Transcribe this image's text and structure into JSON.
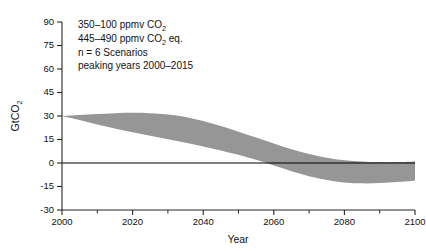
{
  "chart_data": {
    "type": "area",
    "title": "",
    "xlabel": "Year",
    "ylabel": "GtCO2",
    "ylabel_display": "GtCO₂",
    "xlim": [
      2000,
      2100
    ],
    "ylim": [
      -30,
      90
    ],
    "grid": false,
    "legend": null,
    "band_color": "#969696",
    "zero_line": 0,
    "x_ticks": [
      2000,
      2020,
      2040,
      2060,
      2080,
      2100
    ],
    "x_tick_labels": [
      "2000",
      "2020",
      "2040",
      "2060",
      "2080",
      "2100"
    ],
    "x_minor_ticks": [
      2010,
      2030,
      2050,
      2070,
      2090
    ],
    "y_ticks": [
      -30,
      -15,
      0,
      15,
      30,
      45,
      60,
      75,
      90
    ],
    "y_tick_labels": [
      "-30",
      "-15",
      "0",
      "15",
      "30",
      "45",
      "60",
      "75",
      "90"
    ],
    "series": [
      {
        "name": "Upper bound of scenario band",
        "x": [
          2000,
          2005,
          2010,
          2015,
          2020,
          2025,
          2030,
          2035,
          2040,
          2045,
          2050,
          2055,
          2060,
          2065,
          2070,
          2075,
          2080,
          2085,
          2090,
          2095,
          2100
        ],
        "values": [
          30.0,
          30.6,
          31.2,
          31.8,
          32.0,
          31.8,
          31.0,
          29.4,
          26.8,
          23.6,
          20.0,
          16.2,
          12.4,
          8.8,
          5.8,
          3.4,
          1.8,
          1.0,
          0.6,
          0.6,
          1.0
        ]
      },
      {
        "name": "Lower bound of scenario band",
        "x": [
          2000,
          2005,
          2010,
          2015,
          2020,
          2025,
          2030,
          2035,
          2040,
          2045,
          2050,
          2055,
          2060,
          2065,
          2070,
          2075,
          2080,
          2085,
          2090,
          2095,
          2100
        ],
        "values": [
          30.0,
          27.4,
          24.6,
          22.0,
          19.6,
          17.4,
          15.2,
          13.0,
          10.6,
          8.0,
          5.2,
          2.0,
          -1.6,
          -5.2,
          -8.4,
          -10.8,
          -12.4,
          -13.0,
          -12.8,
          -12.2,
          -11.4
        ]
      }
    ],
    "annotations": [
      {
        "id": "scenario-note",
        "lines": [
          {
            "id": "line-1",
            "pre": "350–100 ppmv CO",
            "sub": "2",
            "post": ""
          },
          {
            "id": "line-2",
            "pre": "445–490 ppmv CO",
            "sub": "2",
            "post": " eq."
          },
          {
            "id": "line-3",
            "pre": "n = 6 Scenarios",
            "sub": "",
            "post": ""
          },
          {
            "id": "line-4",
            "pre": "peaking years 2000–2015",
            "sub": "",
            "post": ""
          }
        ]
      }
    ]
  },
  "axes": {
    "x_title": "Year",
    "y_title_main": "GtCO",
    "y_title_sub": "2"
  }
}
